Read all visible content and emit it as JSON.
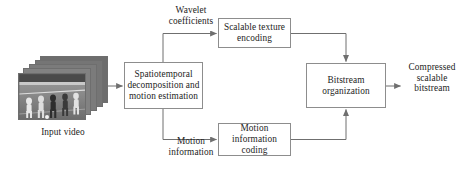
{
  "diagram": {
    "type": "block-flow-diagram",
    "nodes": [
      {
        "id": "spatiotemporal",
        "label": "Spatiotemporal\ndecomposition and\nmotion estimation"
      },
      {
        "id": "texture",
        "label": "Scalable texture\nencoding"
      },
      {
        "id": "motioncoding",
        "label": "Motion\ninformation\ncoding"
      },
      {
        "id": "bitstream",
        "label": "Bitstream\norganization"
      }
    ],
    "edge_labels": [
      {
        "id": "wavelet",
        "label": "Wavelet\ncoefficients"
      },
      {
        "id": "motion-information",
        "label": "Motion\ninformation"
      },
      {
        "id": "compressed-output",
        "label": "Compressed\nscalable\nbitstream"
      }
    ],
    "captions": [
      {
        "id": "input-video",
        "label": "Input video"
      }
    ],
    "colors": {
      "box_border": "#8d8d8d",
      "arrow": "#6f6f6f",
      "text": "#1c1c1c",
      "background": "#ffffff",
      "film_border": "#6e6e6e"
    },
    "film_stack": {
      "frame_count": 5,
      "scene": "grayscale soccer players"
    }
  }
}
